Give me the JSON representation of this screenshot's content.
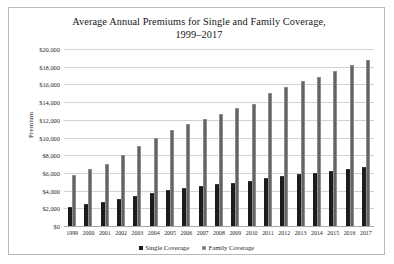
{
  "figure": {
    "title_line1": "Average Annual Premiums for Single and Family Coverage,",
    "title_line2": "1999–2017",
    "border_color": "#b9b9b9",
    "background": "#ffffff"
  },
  "chart_data": {
    "type": "bar",
    "title": "Average Annual Premiums for Single and Family Coverage, 1999–2017",
    "xlabel": "",
    "ylabel": "Premium",
    "ylim": [
      0,
      20000
    ],
    "ytick_labels": [
      "$0",
      "$2,000",
      "$4,000",
      "$6,000",
      "$8,000",
      "$10,000",
      "$12,000",
      "$14,000",
      "$16,000",
      "$18,000",
      "$20,000"
    ],
    "ytick_values": [
      0,
      2000,
      4000,
      6000,
      8000,
      10000,
      12000,
      14000,
      16000,
      18000,
      20000
    ],
    "ytick_step": 2000,
    "grid": true,
    "legend_position": "bottom",
    "categories": [
      "1999",
      "2000",
      "2001",
      "2002",
      "2003",
      "2004",
      "2005",
      "2006",
      "2007",
      "2008",
      "2009",
      "2010",
      "2011",
      "2012",
      "2013",
      "2014",
      "2015",
      "2016",
      "2017"
    ],
    "series": [
      {
        "name": "Single Coverage",
        "color": "#1c1c1c",
        "values": [
          2196,
          2471,
          2689,
          3083,
          3383,
          3695,
          4024,
          4242,
          4479,
          4704,
          4824,
          5049,
          5429,
          5615,
          5884,
          6025,
          6251,
          6435,
          6690
        ]
      },
      {
        "name": "Family Coverage",
        "color": "#636363",
        "values": [
          5791,
          6438,
          7061,
          8003,
          9068,
          9950,
          10880,
          11480,
          12106,
          12680,
          13375,
          13770,
          15073,
          15745,
          16351,
          16834,
          17545,
          18142,
          18764
        ]
      }
    ]
  },
  "legend": {
    "items": [
      {
        "label": "Single Coverage",
        "swatch": "single"
      },
      {
        "label": "Family Coverage",
        "swatch": "family"
      }
    ]
  }
}
